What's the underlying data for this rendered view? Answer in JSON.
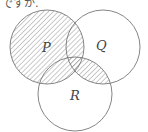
{
  "caption": "ですか.",
  "diagram": {
    "type": "venn",
    "sets": [
      {
        "name": "P",
        "cx": 47,
        "cy": 47,
        "r": 37
      },
      {
        "name": "Q",
        "cx": 103,
        "cy": 47,
        "r": 37
      },
      {
        "name": "R",
        "cx": 75,
        "cy": 94,
        "r": 37
      }
    ],
    "shaded_regions": [
      "P",
      "Q ∩ R"
    ],
    "labels": {
      "p": "P",
      "q": "Q",
      "r": "R"
    },
    "colors": {
      "stroke": "#777777",
      "hatch": "#888888"
    }
  }
}
